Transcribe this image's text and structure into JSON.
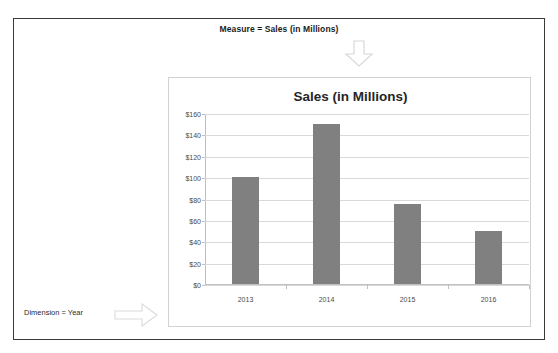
{
  "frame": {
    "measure_caption": "Measure = Sales (in Millions)",
    "dimension_caption": "Dimension = Year",
    "down_arrow_icon": "arrow-down-icon",
    "right_arrow_icon": "arrow-right-icon",
    "border_color": "#3a3a3a"
  },
  "chart_panel": {
    "border_color": "#d2d2d2"
  },
  "chart_data": {
    "type": "bar",
    "title": "Sales (in Millions)",
    "xlabel": "",
    "ylabel": "",
    "categories": [
      "2013",
      "2014",
      "2015",
      "2016"
    ],
    "values": [
      100,
      150,
      75,
      50
    ],
    "ylim": [
      0,
      160
    ],
    "ytick_values": [
      0,
      20,
      40,
      60,
      80,
      100,
      120,
      140,
      160
    ],
    "ytick_labels": [
      "$0",
      "$20",
      "$40",
      "$60",
      "$80",
      "$100",
      "$120",
      "$140",
      "$160"
    ],
    "grid": true,
    "legend": false,
    "bar_color": "#808080",
    "gridline_color": "#d9d9d9",
    "axis_color": "#bfbfbf"
  }
}
